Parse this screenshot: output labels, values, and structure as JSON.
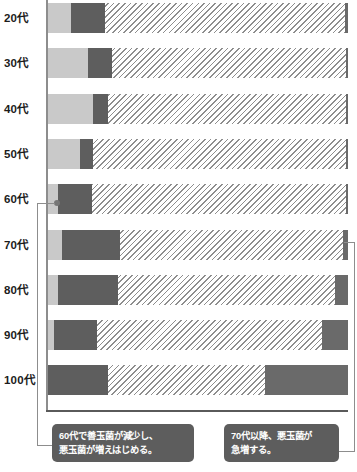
{
  "chart_data": {
    "type": "bar",
    "orientation": "horizontal",
    "stacked": true,
    "title": "",
    "xlabel": "",
    "ylabel": "",
    "grid": false,
    "legend": "none",
    "xlim": [
      0,
      100
    ],
    "categories": [
      "20代",
      "30代",
      "40代",
      "50代",
      "60代",
      "70代",
      "80代",
      "90代",
      "100代"
    ],
    "series": [
      {
        "name": "善玉菌",
        "color": "#c9c9c9",
        "pattern": "solid-light",
        "values": [
          7.7,
          13.3,
          15.0,
          10.7,
          3.3,
          4.7,
          3.3,
          2.0,
          0.0
        ]
      },
      {
        "name": "悪玉菌",
        "color": "#5e5e5e",
        "pattern": "solid-dark",
        "values": [
          11.3,
          8.0,
          5.0,
          4.3,
          11.3,
          19.3,
          20.0,
          14.3,
          20.0
        ]
      },
      {
        "name": "日和見菌",
        "color": "#ffffff",
        "pattern": "diagonal-hatch",
        "values": [
          80.0,
          78.0,
          79.3,
          84.3,
          84.7,
          74.3,
          72.3,
          75.0,
          52.3
        ]
      },
      {
        "name": "悪玉菌（増加分）",
        "color": "#6a6a6a",
        "pattern": "solid-dark",
        "values": [
          1.0,
          0.7,
          0.7,
          0.7,
          0.7,
          1.7,
          4.4,
          8.7,
          27.7
        ]
      }
    ],
    "annotations": [
      {
        "id": "annotation-60s",
        "target_category": "60代",
        "lines": [
          "60代で善玉菌が減少し、",
          "悪玉菌が増えはじめる。"
        ],
        "text": "60代で善玉菌が減少し、悪玉菌が増えはじめる。",
        "background": "#5d5d5d",
        "text_color": "#ffffff"
      },
      {
        "id": "annotation-70s-plus",
        "target_category": "70代",
        "lines": [
          "70代以降、悪玉菌が",
          "急増する。"
        ],
        "text": "70代以降、悪玉菌が急増する。",
        "background": "#5d5d5d",
        "text_color": "#ffffff"
      }
    ]
  }
}
